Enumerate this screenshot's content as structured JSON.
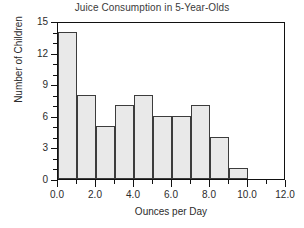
{
  "chart_data": {
    "type": "bar",
    "title": "Juice Consumption in 5-Year-Olds",
    "xlabel": "Ounces per Day",
    "ylabel": "Number of Children",
    "categories": [
      "0-1",
      "1-2",
      "2-3",
      "3-4",
      "4-5",
      "5-6",
      "6-7",
      "7-8",
      "8-9",
      "9-10"
    ],
    "bin_edges": [
      0,
      1,
      2,
      3,
      4,
      5,
      6,
      7,
      8,
      9,
      10
    ],
    "values": [
      14,
      8,
      5,
      7,
      8,
      6,
      6,
      7,
      4,
      1
    ],
    "xlim": [
      0,
      12
    ],
    "ylim": [
      0,
      15
    ],
    "x_major_ticks": [
      0,
      2,
      4,
      6,
      8,
      10,
      12
    ],
    "x_major_tick_labels": [
      "0.0",
      "2.0",
      "4.0",
      "6.0",
      "8.0",
      "10.0",
      "12.0"
    ],
    "x_minor_ticks": [
      1,
      3,
      5,
      7,
      9,
      11
    ],
    "y_major_ticks": [
      0,
      3,
      6,
      9,
      12,
      15
    ],
    "y_major_tick_labels": [
      "0",
      "3",
      "6",
      "9",
      "12",
      "15"
    ],
    "y_minor_ticks": [
      1,
      2,
      4,
      5,
      7,
      8,
      10,
      11,
      13,
      14
    ],
    "grid": false,
    "legend": null,
    "bar_fill_color": "#e9e9e9",
    "bar_edge_color": "#3c3c3c",
    "frame_color": "#111111"
  }
}
